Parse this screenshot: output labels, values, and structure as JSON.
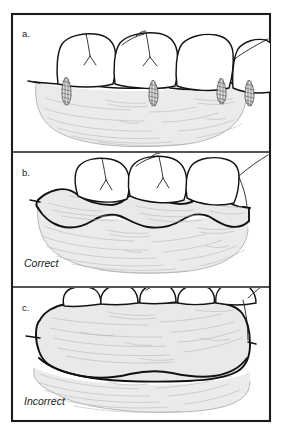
{
  "figure": {
    "background_color": "#ffffff",
    "frame_color": "#1b1b1b",
    "tissue_color": "#ebebeb",
    "material_color": "#e9e9e9",
    "outline_color": "#111111",
    "panel_count": 3
  },
  "panels": [
    {
      "letter": "a.",
      "caption": "",
      "name": "panel-a-anatomy",
      "description": "Posterior teeth with interdental papillae on alveolar ridge, no impression material"
    },
    {
      "letter": "b.",
      "caption": "Correct",
      "name": "panel-b-correct",
      "description": "Thin scalloped impression material closely adapted to tooth contours and gingival margin"
    },
    {
      "letter": "c.",
      "caption": "Incorrect",
      "name": "panel-c-incorrect",
      "description": "Thick block of impression material covering teeth and obscuring margins"
    }
  ]
}
